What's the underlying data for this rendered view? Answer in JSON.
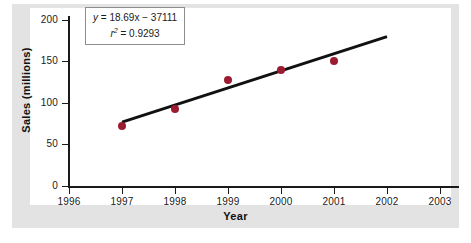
{
  "chart_data": {
    "type": "scatter",
    "title": "",
    "xlabel": "Year",
    "ylabel": "Sales  (millions)",
    "x": [
      1997,
      1998,
      1999,
      2000,
      2001
    ],
    "values": [
      72,
      93,
      128,
      140,
      151
    ],
    "series": [
      {
        "name": "Sales",
        "x": [
          1997,
          1998,
          1999,
          2000,
          2001
        ],
        "values": [
          72,
          93,
          128,
          140,
          151
        ],
        "marker_color": "#9b1b30"
      }
    ],
    "trendline": {
      "equation": "y = 18.69x - 37111",
      "slope": 18.69,
      "intercept": -37111,
      "r_squared": 0.9293,
      "x_start": 1997,
      "x_end": 2002,
      "y_start": 77,
      "y_end": 180,
      "color": "#111111"
    },
    "xlim": [
      1996,
      2003
    ],
    "ylim": [
      0,
      210
    ],
    "xticks": [
      1996,
      1997,
      1998,
      1999,
      2000,
      2001,
      2002,
      2003
    ],
    "yticks": [
      0,
      50,
      100,
      150,
      200
    ],
    "grid": false,
    "legend": false
  },
  "annotation": {
    "equation_lhs": "y",
    "equation_rest": " =  18.69x  −  37111",
    "r_symbol": "r",
    "r_exponent": "2",
    "r_value": " =  0.9293"
  },
  "axes": {
    "x_title": "Year",
    "y_title": "Sales  (millions)",
    "x_tick_labels": [
      "1996",
      "1997",
      "1998",
      "1999",
      "2000",
      "2001",
      "2002",
      "2003"
    ],
    "y_tick_labels": [
      "200",
      "150",
      "100",
      "50",
      "0"
    ]
  },
  "colors": {
    "marker": "#9b1b30",
    "trendline": "#111111",
    "axis": "#1a1a1a",
    "frame_band": "#e3e3e3",
    "plot_background": "#ffffff"
  }
}
